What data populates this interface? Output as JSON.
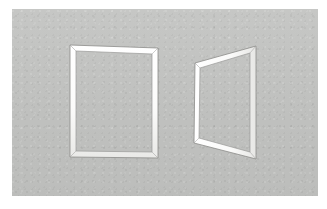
{
  "scene": {
    "title": "Two quadrilateral frames on a gray ground",
    "width": 327,
    "height": 209,
    "background_color": "#ffffff"
  },
  "canvas": {
    "name": "gray-ground-panel",
    "x": 12,
    "y": 9,
    "width": 306,
    "height": 187,
    "fill_color": "#c3c4c2",
    "texture": "paper-grain"
  },
  "figures": [
    {
      "id": "left-frame",
      "label": "Rectangular frame (front view)",
      "shape": "rectangle",
      "outer_points": "70,45 158,48 158,158 70,157",
      "inner_points": "76,51 152,54 152,152 76,151",
      "band_fill": "#fdfdfc",
      "stroke_color": "#8b8b89",
      "stroke_width": 0.7,
      "band_width_px": 5
    },
    {
      "id": "right-frame",
      "label": "Trapezoidal frame (perspective view)",
      "shape": "trapezoid",
      "outer_points": "195,63 256,46 256,159 194,143",
      "inner_points": "200,68 250,53 250,152 199,138",
      "band_fill": "#fdfdfc",
      "stroke_color": "#8b8b89",
      "stroke_width": 0.7,
      "band_width_px": 5
    }
  ],
  "palette": {
    "ground": "#c3c4c2",
    "frame_highlight": "#fdfdfc",
    "frame_line": "#8b8b89",
    "paper_white": "#ffffff"
  }
}
